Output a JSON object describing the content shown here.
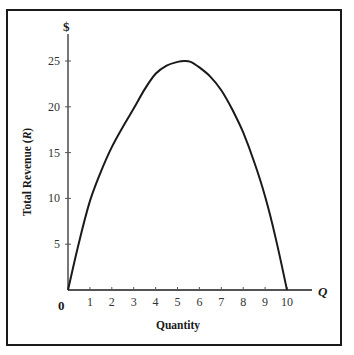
{
  "chart_data": {
    "type": "line",
    "title": "",
    "xlabel": "Quantity",
    "ylabel": "Total Revenue (R)",
    "x_axis_symbol": "Q",
    "y_axis_symbol": "$",
    "origin_label": "0",
    "xlim": [
      0,
      11.5
    ],
    "ylim": [
      0,
      28
    ],
    "x_ticks": [
      1,
      2,
      3,
      4,
      5,
      6,
      7,
      8,
      9,
      10
    ],
    "y_ticks": [
      5,
      10,
      15,
      20,
      25
    ],
    "grid": false,
    "legend": null,
    "series": [
      {
        "name": "Total Revenue",
        "x": [
          0,
          0.5,
          1,
          1.5,
          2,
          2.5,
          3,
          3.5,
          4,
          4.5,
          5,
          5.3,
          5.6,
          6,
          6.5,
          7,
          7.5,
          8,
          8.5,
          9,
          9.5,
          10
        ],
        "values": [
          0,
          5.2,
          9.7,
          12.9,
          15.6,
          17.8,
          19.8,
          21.9,
          23.6,
          24.5,
          24.9,
          25.0,
          24.9,
          24.3,
          23.3,
          21.8,
          19.7,
          17.2,
          14.0,
          10.2,
          5.5,
          0
        ]
      }
    ]
  }
}
